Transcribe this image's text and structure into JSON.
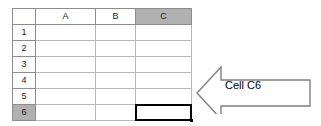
{
  "spreadsheet": {
    "corner_label": "",
    "column_headers": [
      {
        "label": "A",
        "selected": false
      },
      {
        "label": "B",
        "selected": false
      },
      {
        "label": "C",
        "selected": true
      }
    ],
    "row_headers": [
      {
        "label": "1",
        "selected": false
      },
      {
        "label": "2",
        "selected": false
      },
      {
        "label": "3",
        "selected": false
      },
      {
        "label": "4",
        "selected": false
      },
      {
        "label": "5",
        "selected": false
      },
      {
        "label": "6",
        "selected": true
      }
    ],
    "cells": [
      [
        "",
        "",
        ""
      ],
      [
        "",
        "",
        ""
      ],
      [
        "",
        "",
        ""
      ],
      [
        "",
        "",
        ""
      ],
      [
        "",
        "",
        ""
      ],
      [
        "",
        "",
        ""
      ]
    ],
    "selected_cell": "C6",
    "colors": {
      "header_fill": "#d4d4d4",
      "header_selected_fill": "#b0b0b0",
      "header_border": "#8d8d8d",
      "grid_line": "#b9b9b9",
      "cell_fill": "#ffffff",
      "selection_border": "#000000"
    }
  },
  "callout": {
    "label": "Cell C6",
    "direction": "left",
    "stroke_color": "#808080",
    "fill_color": "#ffffff",
    "text_color": "#000000"
  }
}
